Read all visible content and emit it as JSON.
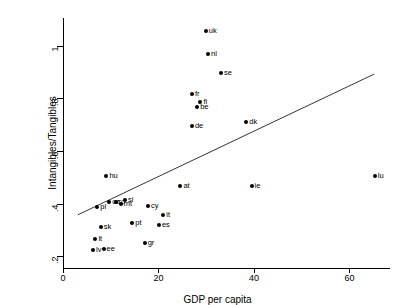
{
  "chart_data": {
    "type": "scatter",
    "title": "",
    "xlabel": "GDP per capita",
    "ylabel": "Intangibles/Tangibles",
    "xlim": [
      0,
      68.5
    ],
    "ylim": [
      0.155,
      1.105
    ],
    "xticks": [
      0,
      20,
      40,
      60
    ],
    "xtick_labels": [
      "0",
      "20",
      "40",
      "60"
    ],
    "yticks": [
      0.2,
      0.4,
      0.6,
      0.8,
      1
    ],
    "ytick_labels": [
      ".2",
      ".4",
      ".6",
      ".8",
      "1"
    ],
    "grid": false,
    "legend": false,
    "point_label_position": "right",
    "points": [
      {
        "label": "uk",
        "x": 29.9,
        "y": 1.055
      },
      {
        "label": "nl",
        "x": 30.4,
        "y": 0.97
      },
      {
        "label": "se",
        "x": 33.1,
        "y": 0.895
      },
      {
        "label": "fr",
        "x": 27.0,
        "y": 0.815
      },
      {
        "label": "fi",
        "x": 28.8,
        "y": 0.785
      },
      {
        "label": "be",
        "x": 28.1,
        "y": 0.765
      },
      {
        "label": "dk",
        "x": 38.4,
        "y": 0.71
      },
      {
        "label": "de",
        "x": 27.0,
        "y": 0.695
      },
      {
        "label": "hu",
        "x": 9.1,
        "y": 0.505
      },
      {
        "label": "lu",
        "x": 65.3,
        "y": 0.505
      },
      {
        "label": "at",
        "x": 24.6,
        "y": 0.465
      },
      {
        "label": "ie",
        "x": 39.5,
        "y": 0.465
      },
      {
        "label": "si",
        "x": 13.0,
        "y": 0.415
      },
      {
        "label": "ro",
        "x": 11.0,
        "y": 0.405
      },
      {
        "label": "mt",
        "x": 12.1,
        "y": 0.398
      },
      {
        "label": "cz",
        "x": 9.7,
        "y": 0.405
      },
      {
        "label": "cy",
        "x": 17.8,
        "y": 0.39
      },
      {
        "label": "pl",
        "x": 7.2,
        "y": 0.385
      },
      {
        "label": "it",
        "x": 21.0,
        "y": 0.355
      },
      {
        "label": "pt",
        "x": 14.5,
        "y": 0.325
      },
      {
        "label": "es",
        "x": 20.1,
        "y": 0.32
      },
      {
        "label": "sk",
        "x": 7.9,
        "y": 0.31
      },
      {
        "label": "lt",
        "x": 6.8,
        "y": 0.265
      },
      {
        "label": "gr",
        "x": 17.1,
        "y": 0.25
      },
      {
        "label": "lv",
        "x": 6.3,
        "y": 0.225
      },
      {
        "label": "ee",
        "x": 8.5,
        "y": 0.228
      }
    ],
    "trendline": {
      "type": "linear-fit",
      "x_start": 3.1,
      "y_start": 0.357,
      "x_end": 65.2,
      "y_end": 0.892
    }
  }
}
